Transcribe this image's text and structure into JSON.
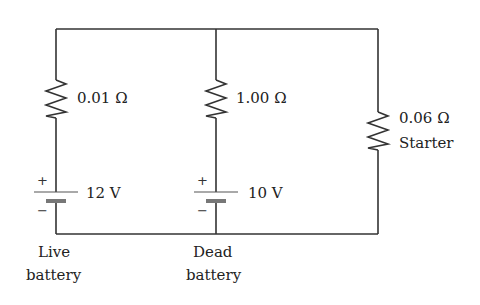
{
  "circuit": {
    "wire_color": "#333333",
    "resistors": [
      {
        "id": "live",
        "label": "0.01 Ω"
      },
      {
        "id": "dead",
        "label": "1.00 Ω"
      },
      {
        "id": "starter",
        "label": "0.06 Ω",
        "sublabel": "Starter"
      }
    ],
    "batteries": [
      {
        "id": "live",
        "voltage": "12 V",
        "plus": "+",
        "minus": "−",
        "caption_line1": "Live",
        "caption_line2": "battery"
      },
      {
        "id": "dead",
        "voltage": "10 V",
        "plus": "+",
        "minus": "−",
        "caption_line1": "Dead",
        "caption_line2": "battery"
      }
    ]
  }
}
